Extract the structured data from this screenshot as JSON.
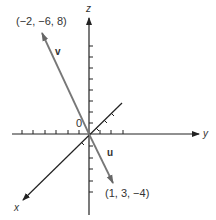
{
  "diagram": {
    "title": "",
    "axes": {
      "x_label": "x",
      "y_label": "y",
      "z_label": "z",
      "origin_label": "0"
    },
    "vectors": [
      {
        "name": "v",
        "label": "v",
        "endpoint": "(−2, −6, 8)",
        "components": [
          -2,
          -6,
          8
        ],
        "color": "#777777"
      },
      {
        "name": "u",
        "label": "u",
        "endpoint": "(1, 3, −4)",
        "components": [
          1,
          3,
          -4
        ],
        "color": "#777777"
      }
    ],
    "colors": {
      "axis": "#222222",
      "vector": "#777777",
      "background": "#ffffff"
    }
  }
}
